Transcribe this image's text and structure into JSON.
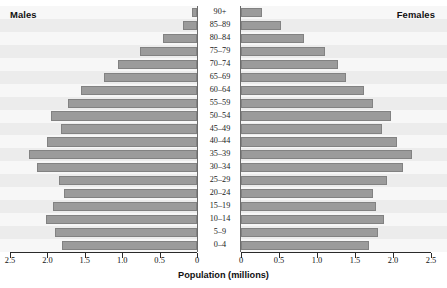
{
  "chart_data": {
    "type": "bar",
    "title": "",
    "subtitle": "",
    "xlabel": "Population (millions)",
    "ylabel": "",
    "orientation": "horizontal-diverging",
    "layout": "population-pyramid",
    "grid": false,
    "legend_position": "in-plot-corners",
    "axis": {
      "left_label": "Males",
      "right_label": "Females",
      "left_range": [
        2.5,
        0
      ],
      "right_range": [
        0,
        2.5
      ],
      "tick_values": [
        0,
        0.5,
        1.0,
        1.5,
        2.0,
        2.5
      ],
      "left_tick_labels": [
        "2.5",
        "2.0",
        "1.5",
        "1.0",
        "0.5",
        "0"
      ],
      "right_tick_labels": [
        "0",
        "0.5",
        "1.0",
        "1.5",
        "2.0",
        "2.5"
      ],
      "units": "millions"
    },
    "categories": [
      "90+",
      "85–89",
      "80–84",
      "75–79",
      "70–74",
      "65–69",
      "60–64",
      "55–59",
      "50–54",
      "45–49",
      "40–44",
      "35–39",
      "30–34",
      "25–29",
      "20–24",
      "15–19",
      "10–14",
      "5–9",
      "0–4"
    ],
    "series": [
      {
        "name": "Males",
        "side": "left",
        "color": "#9b9b9b",
        "values": [
          0.07,
          0.19,
          0.45,
          0.76,
          1.05,
          1.25,
          1.55,
          1.72,
          1.95,
          1.82,
          2.0,
          2.25,
          2.14,
          1.85,
          1.78,
          1.92,
          2.02,
          1.9,
          1.8
        ]
      },
      {
        "name": "Females",
        "side": "right",
        "color": "#9b9b9b",
        "values": [
          0.28,
          0.53,
          0.83,
          1.1,
          1.28,
          1.38,
          1.62,
          1.74,
          1.98,
          1.86,
          2.05,
          2.25,
          2.13,
          1.92,
          1.74,
          1.77,
          1.88,
          1.8,
          1.68
        ]
      }
    ]
  },
  "labels": {
    "males": "Males",
    "females": "Females",
    "axis_title": "Population (millions)"
  }
}
